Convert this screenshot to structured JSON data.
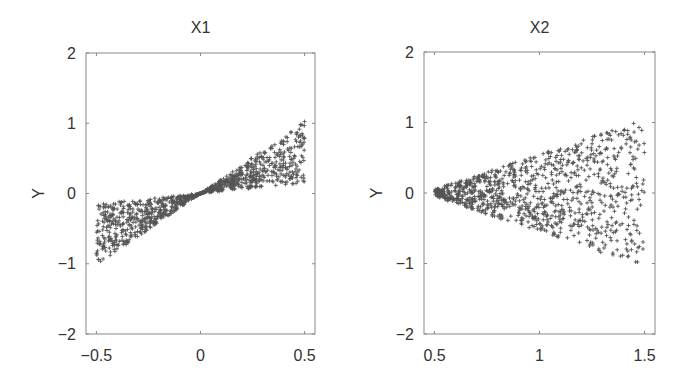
{
  "chart_data": [
    {
      "type": "scatter",
      "title": "X1",
      "xlabel": "",
      "ylabel": "Y",
      "xlim": [
        -0.55,
        0.55
      ],
      "ylim": [
        -2,
        2
      ],
      "xticks": [
        "-0.5",
        "0",
        "0.5"
      ],
      "xtick_values": [
        -0.5,
        0,
        0.5
      ],
      "yticks": [
        "2",
        "1",
        "0",
        "-1",
        "-2"
      ],
      "ytick_values": [
        2,
        1,
        0,
        -1,
        -2
      ],
      "grid": false,
      "marker": "+",
      "marker_color": "#555555",
      "n_points": 1000,
      "description": "Points with x uniform in [-0.5, 0.5]; y lies between 0.2*x and 2*x (bow-tie shape through the origin)",
      "generator": {
        "x_range": [
          -0.5,
          0.5
        ],
        "y_low_factor": 0.3,
        "y_high_factor": 2.05,
        "mode": "bowtie"
      }
    },
    {
      "type": "scatter",
      "title": "X2",
      "xlabel": "",
      "ylabel": "Y",
      "xlim": [
        0.45,
        1.55
      ],
      "ylim": [
        -2,
        2
      ],
      "xticks": [
        "0.5",
        "1",
        "1.5"
      ],
      "xtick_values": [
        0.5,
        1,
        1.5
      ],
      "yticks": [
        "2",
        "1",
        "0",
        "-1",
        "-2"
      ],
      "ytick_values": [
        2,
        1,
        0,
        -1,
        -2
      ],
      "grid": false,
      "marker": "+",
      "marker_color": "#555555",
      "n_points": 1000,
      "description": "Points with x uniform in [0.5, 1.5]; y spread in a widening fan, approx |y| <= (x-0.45)",
      "generator": {
        "x_range": [
          0.5,
          1.5
        ],
        "spread_offset": 0.45,
        "mode": "fan"
      }
    }
  ],
  "panels": [
    {
      "title": "X1",
      "ylabel": "Y"
    },
    {
      "title": "X2",
      "ylabel": "Y"
    }
  ]
}
